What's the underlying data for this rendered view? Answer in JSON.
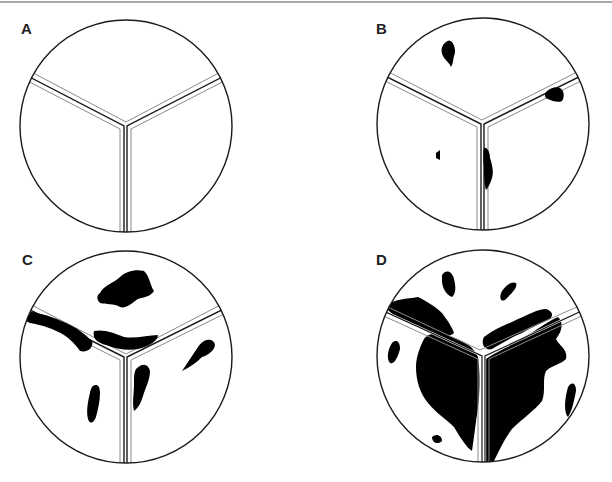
{
  "figure": {
    "panels": [
      {
        "id": "A",
        "label": "A",
        "description": "Clean corner, no deposits"
      },
      {
        "id": "B",
        "label": "B",
        "description": "Few small dark spots"
      },
      {
        "id": "C",
        "label": "C",
        "description": "Moderate dark patches along seams"
      },
      {
        "id": "D",
        "label": "D",
        "description": "Extensive dark coverage"
      }
    ]
  },
  "colors": {
    "outline": "#1a1a1a",
    "seam_light": "#8a8a8a",
    "fill": "#000000",
    "background": "#ffffff"
  }
}
